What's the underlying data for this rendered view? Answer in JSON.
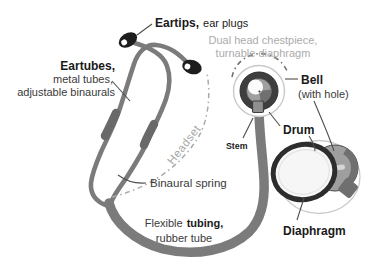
{
  "diagram": {
    "labels": {
      "eartips": {
        "name": "Eartips,",
        "desc": "ear plugs"
      },
      "eartubes": {
        "name": "Eartubes,",
        "desc1": "metal tubes,",
        "desc2": "adjustable binaurals"
      },
      "chestpiece": {
        "line1": "Dual head chestpiece,",
        "line2": "turnable diaphragm"
      },
      "bell": {
        "name": "Bell",
        "desc": "(with hole)"
      },
      "drum": {
        "name": "Drum"
      },
      "stem": {
        "name": "Stem"
      },
      "diaphragm": {
        "name": "Diaphragm"
      },
      "binaural_spring": {
        "name": "Binaural spring"
      },
      "tubing": {
        "pre": "Flexible",
        "name": "tubing,",
        "desc": "rubber tube"
      },
      "headset": {
        "name": "Headset"
      }
    },
    "colors": {
      "background": "#ffffff",
      "tube_gray": "#7b7b7b",
      "binaural_segment_dark": "#696969",
      "eartip_black": "#1d1d1d",
      "chestpiece_ring_dark": "#3e3e3e",
      "bell_gray": "#9f9f9f",
      "bell_wedge": "#707070",
      "faint_ring": "#c9c9c9",
      "diaphragm_rim": "#2d2d2d",
      "muted_label": "#ababab",
      "leader_line": "#4f4f4f",
      "label_text": "#1a1a1a"
    }
  }
}
